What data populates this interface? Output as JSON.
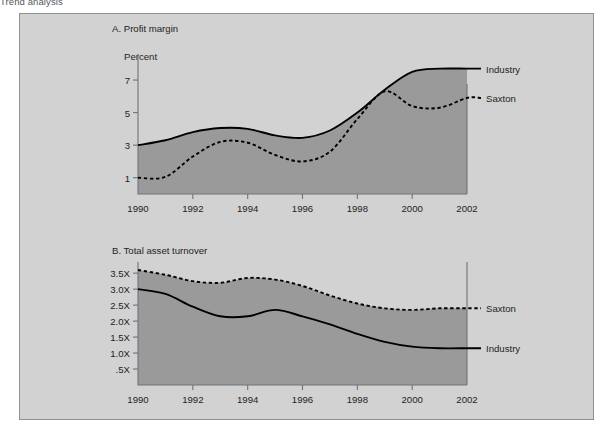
{
  "caption": "Trend analysis",
  "colors": {
    "panel_bg": "#d2d2d2",
    "area_fill": "#9a9a9a",
    "line": "#000000",
    "axis": "#6f7377",
    "text": "#1d1f21"
  },
  "chart_data": [
    {
      "type": "line",
      "title": "A. Profit margin",
      "ylabel": "Percent",
      "xlabel": "",
      "grid": false,
      "legend_position": "right-of-plot",
      "xlim": [
        1990,
        2002
      ],
      "ylim": [
        0,
        8.6
      ],
      "yticks": [
        1,
        3,
        5,
        7
      ],
      "ytick_labels": [
        "1",
        "3",
        "5",
        "7"
      ],
      "xticks": [
        1990,
        1992,
        1994,
        1996,
        1998,
        2000,
        2002
      ],
      "xtick_labels": [
        "1990",
        "1992",
        "1994",
        "1996",
        "1998",
        "2000",
        "2002"
      ],
      "x": [
        1990,
        1991,
        1992,
        1993,
        1994,
        1995,
        1996,
        1997,
        1998,
        1999,
        2000,
        2001,
        2002
      ],
      "series": [
        {
          "name": "Industry",
          "style": "solid",
          "values": [
            3.0,
            3.3,
            3.8,
            4.05,
            4.0,
            3.6,
            3.45,
            3.9,
            5.0,
            6.4,
            7.5,
            7.7,
            7.7
          ]
        },
        {
          "name": "Saxton",
          "style": "dashed",
          "values": [
            1.0,
            1.05,
            2.3,
            3.2,
            3.15,
            2.4,
            2.0,
            2.6,
            4.6,
            6.3,
            5.4,
            5.3,
            5.9
          ]
        }
      ]
    },
    {
      "type": "line",
      "title": "B. Total asset turnover",
      "ylabel": "",
      "xlabel": "",
      "grid": false,
      "legend_position": "right-of-plot",
      "xlim": [
        1990,
        2002
      ],
      "ylim": [
        0,
        3.85
      ],
      "yticks": [
        0.5,
        1.0,
        1.5,
        2.0,
        2.5,
        3.0,
        3.5
      ],
      "ytick_labels": [
        ".5X",
        "1.0X",
        "1.5X",
        "2.0X",
        "2.5X",
        "3.0X",
        "3.5X"
      ],
      "xticks": [
        1990,
        1992,
        1994,
        1996,
        1998,
        2000,
        2002
      ],
      "xtick_labels": [
        "1990",
        "1992",
        "1994",
        "1996",
        "1998",
        "2000",
        "2002"
      ],
      "x": [
        1990,
        1991,
        1992,
        1993,
        1994,
        1995,
        1996,
        1997,
        1998,
        1999,
        2000,
        2001,
        2002
      ],
      "series": [
        {
          "name": "Saxton",
          "style": "dashed",
          "values": [
            3.6,
            3.45,
            3.25,
            3.2,
            3.35,
            3.3,
            3.1,
            2.8,
            2.55,
            2.4,
            2.35,
            2.4,
            2.4
          ]
        },
        {
          "name": "Industry",
          "style": "solid",
          "values": [
            3.0,
            2.85,
            2.45,
            2.15,
            2.15,
            2.35,
            2.15,
            1.9,
            1.6,
            1.35,
            1.2,
            1.15,
            1.15
          ]
        }
      ]
    }
  ]
}
